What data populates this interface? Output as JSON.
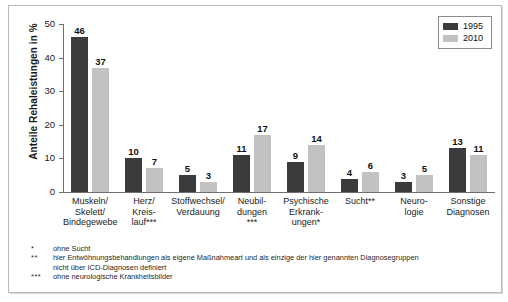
{
  "chart_data": {
    "type": "bar",
    "title": "",
    "xlabel": "",
    "ylabel": "Anteile Rehaleistungen in %",
    "ylim": [
      0,
      50
    ],
    "yticks": [
      0,
      10,
      20,
      30,
      40,
      50
    ],
    "grid": false,
    "legend_position": "top-right",
    "categories": [
      "Muskeln/\nSkelett/\nBindegewebe",
      "Herz/\nKreis-\nlauf***",
      "Stoffwechsel/\nVerdauung",
      "Neubil-\ndungen\n***",
      "Psychische\nErkrank-\nungen*",
      "Sucht**",
      "Neuro-\nlogie",
      "Sonstige\nDiagnosen"
    ],
    "series": [
      {
        "name": "1995",
        "color": "#3b3b3b",
        "values": [
          46,
          10,
          5,
          11,
          9,
          4,
          3,
          13
        ]
      },
      {
        "name": "2010",
        "color": "#c2c2c2",
        "values": [
          37,
          7,
          3,
          17,
          14,
          6,
          5,
          11
        ]
      }
    ]
  },
  "legend": {
    "items": [
      {
        "label": "1995",
        "color": "#3b3b3b"
      },
      {
        "label": "2010",
        "color": "#c2c2c2"
      }
    ]
  },
  "axis": {
    "y_title": "Anteile Rehaleistungen in %",
    "y_tick_labels": [
      "0",
      "10",
      "20",
      "30",
      "40",
      "50"
    ]
  },
  "footnotes": [
    {
      "mark": "*",
      "text": "ohne Sucht",
      "continuation": ""
    },
    {
      "mark": "**",
      "text": "hier Entwöhnungsbehandlungen als eigene Maßnahmeart und als einzige der hier genannten Diagnosegruppen",
      "continuation": "nicht über ICD-Diagnosen definiert"
    },
    {
      "mark": "***",
      "text": "ohne neurologische Krankheitsbilder",
      "continuation": ""
    }
  ]
}
